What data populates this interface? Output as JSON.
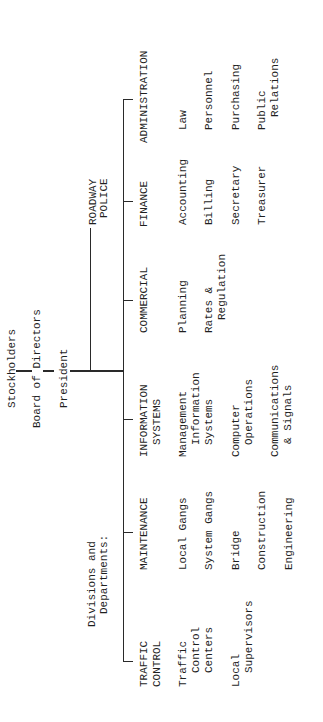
{
  "chain": {
    "stockholders": "Stockholders",
    "board": "Board of Directors",
    "president": "President"
  },
  "staff_unit": {
    "lines": [
      "ROADWAY",
      "POLICE"
    ]
  },
  "divisions_label": {
    "lines": [
      "Divisions and",
      "Departments:"
    ]
  },
  "departments": [
    {
      "header": [
        "TRAFFIC",
        "CONTROL"
      ],
      "units": [
        [
          "Traffic",
          "Control",
          "Centers"
        ],
        [
          "Local",
          "Supervisors"
        ]
      ]
    },
    {
      "header": [
        "MAINTENANCE"
      ],
      "units": [
        [
          "Local Gangs"
        ],
        [
          "System Gangs"
        ],
        [
          "Bridge"
        ],
        [
          "Construction"
        ],
        [
          "Engineering"
        ]
      ]
    },
    {
      "header": [
        "INFORMATION",
        "SYSTEMS"
      ],
      "units": [
        [
          "Management",
          "Information",
          "Systems"
        ],
        [
          "Computer",
          "Operations"
        ],
        [
          "Communications",
          "& Signals"
        ]
      ]
    },
    {
      "header": [
        "COMMERCIAL"
      ],
      "units": [
        [
          "Planning"
        ],
        [
          "Rates &",
          "Regulation"
        ]
      ]
    },
    {
      "header": [
        "FINANCE"
      ],
      "units": [
        [
          "Accounting"
        ],
        [
          "Billing"
        ],
        [
          "Secretary"
        ],
        [
          "Treasurer"
        ]
      ]
    },
    {
      "header": [
        "ADMINISTRATION"
      ],
      "units": [
        [
          "Law"
        ],
        [
          "Personnel"
        ],
        [
          "Purchasing"
        ],
        [
          "Public",
          "Relations"
        ]
      ]
    }
  ],
  "colors": {
    "ink": "#1f1f1f",
    "lines": "#2a2a2a",
    "paper": "#ffffff"
  }
}
